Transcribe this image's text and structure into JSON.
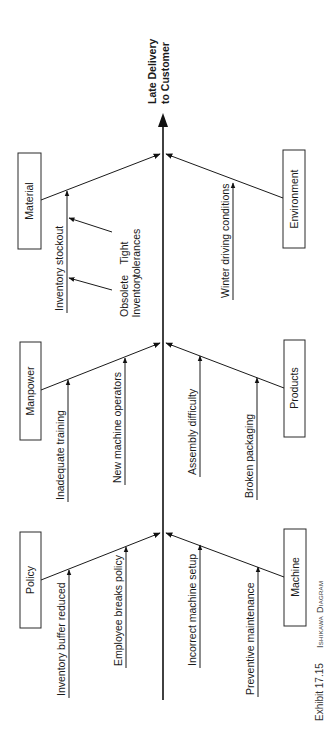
{
  "diagram": {
    "type": "ishikawa",
    "orientation": "rotated-90-ccw",
    "effect": {
      "line1": "Late Delivery",
      "line2": "to Customer"
    },
    "categories": [
      {
        "name": "Material",
        "side": "left",
        "causes": [
          {
            "label": "Inventory stockout",
            "sub_causes": [
              {
                "line1": "Tight",
                "line2": "tolerances"
              },
              {
                "line1": "Obsolete",
                "line2": "Inventory"
              }
            ]
          }
        ]
      },
      {
        "name": "Environment",
        "side": "right",
        "causes": [
          {
            "label": "Winter driving conditions"
          }
        ]
      },
      {
        "name": "Manpower",
        "side": "left",
        "causes": [
          {
            "label": "Inadequate training"
          },
          {
            "label": "New machine operators"
          }
        ]
      },
      {
        "name": "Products",
        "side": "right",
        "causes": [
          {
            "label": "Assembly difficulty"
          },
          {
            "label": "Broken packaging"
          }
        ]
      },
      {
        "name": "Policy",
        "side": "left",
        "causes": [
          {
            "label": "Inventory buffer reduced"
          },
          {
            "label": "Employee breaks policy"
          }
        ]
      },
      {
        "name": "Machine",
        "side": "right",
        "causes": [
          {
            "label": "Incorrect machine setup"
          },
          {
            "label": "Preventive maintenance"
          }
        ]
      }
    ]
  },
  "caption": {
    "exhibit": "Exhibit 17.15",
    "title": "Ishikawa Diagram"
  },
  "colors": {
    "ink": "#1a1a1a",
    "background": "#ffffff"
  }
}
